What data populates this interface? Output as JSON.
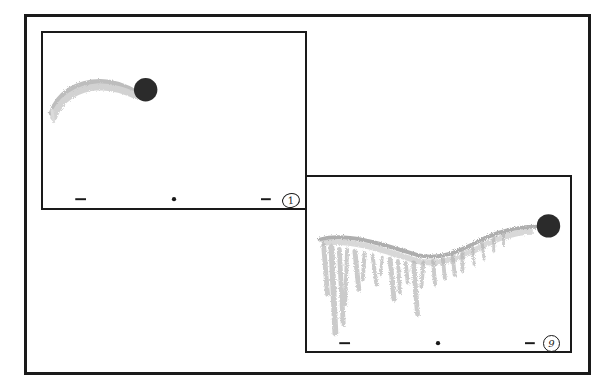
{
  "storyboard": {
    "style": "hand-drawn animation storyboard",
    "colors": {
      "frame_border": "#1a1a1a",
      "ball": "#2b2b2b",
      "trail": "#9a9a9a",
      "background": "#ffffff"
    },
    "panels": [
      {
        "id": "panel-1",
        "frame_label": "1",
        "ball": {
          "cx": 104,
          "cy": 58,
          "r": 12
        },
        "markers": [
          "dash-left",
          "dot-center",
          "dash-right"
        ],
        "trail": "short arc from lower-left rising into the ball"
      },
      {
        "id": "panel-9",
        "frame_label": "9",
        "ball": {
          "cx": 246,
          "cy": 50,
          "r": 12
        },
        "markers": [
          "dash-left",
          "dot-center",
          "dash-right"
        ],
        "trail": "long wavy trail with dripping streaks below"
      }
    ]
  }
}
